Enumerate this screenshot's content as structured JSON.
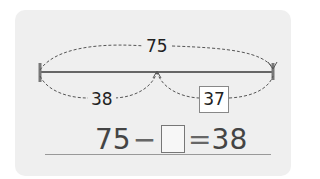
{
  "diagram": {
    "total_label": "75",
    "left_segment_label": "38",
    "right_segment_label": "37",
    "colors": {
      "card_background": "#efefef",
      "line": "#666666",
      "dashed_arc": "#555555",
      "text": "#222222"
    }
  },
  "equation": {
    "minuend": "75",
    "operator": "−",
    "blank": "",
    "equals": "=",
    "result": "38"
  }
}
